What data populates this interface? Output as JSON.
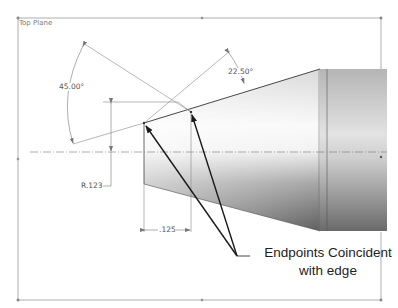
{
  "sketch": {
    "plane_label": "Top Plane"
  },
  "dimensions": {
    "angle_large": "45.00°",
    "angle_small": "22.50°",
    "radius": "R.123",
    "length": ".125"
  },
  "callout": {
    "line1": "Endpoints Coincident",
    "line2": "with edge"
  },
  "colors": {
    "sketch_line": "#8a8a8a",
    "arrow": "#1a1a1a",
    "part_dark": "#6b6b6b",
    "part_light": "#f7f7f7"
  }
}
